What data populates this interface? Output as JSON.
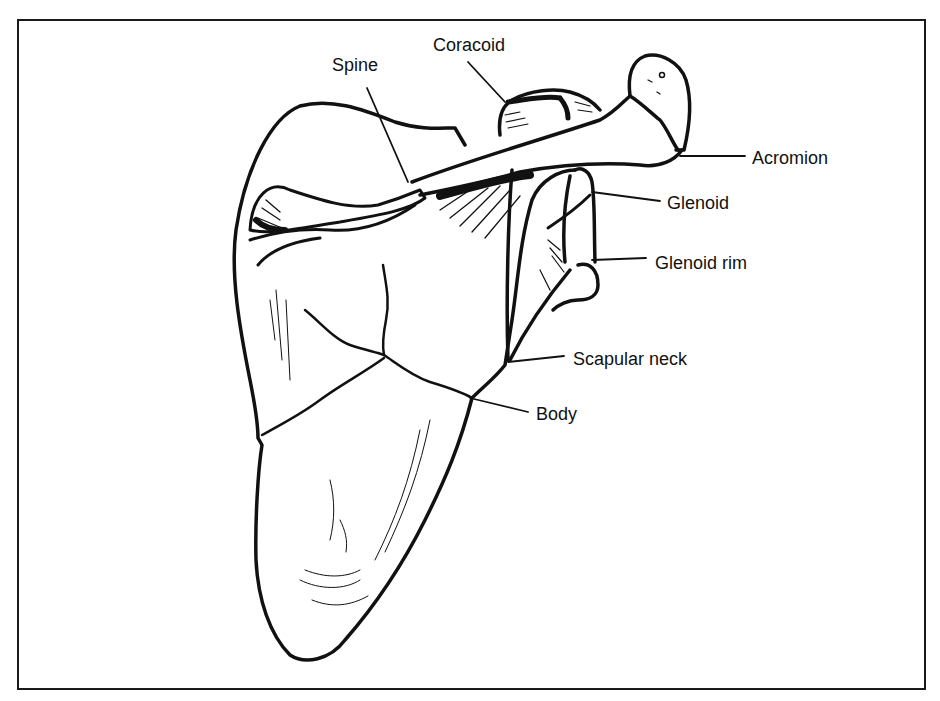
{
  "figure": {
    "colors": {
      "ink": "#111111",
      "background": "#ffffff",
      "frame": "#1a1a1a"
    },
    "labels": [
      {
        "id": "coracoid",
        "text": "Coracoid",
        "x": 433,
        "y": 36
      },
      {
        "id": "spine",
        "text": "Spine",
        "x": 332,
        "y": 56
      },
      {
        "id": "acromion",
        "text": "Acromion",
        "x": 752,
        "y": 149
      },
      {
        "id": "glenoid",
        "text": "Glenoid",
        "x": 667,
        "y": 194
      },
      {
        "id": "glenoid-rim",
        "text": "Glenoid rim",
        "x": 655,
        "y": 254
      },
      {
        "id": "scapular-neck",
        "text": "Scapular neck",
        "x": 573,
        "y": 350
      },
      {
        "id": "body",
        "text": "Body",
        "x": 536,
        "y": 405
      }
    ]
  }
}
